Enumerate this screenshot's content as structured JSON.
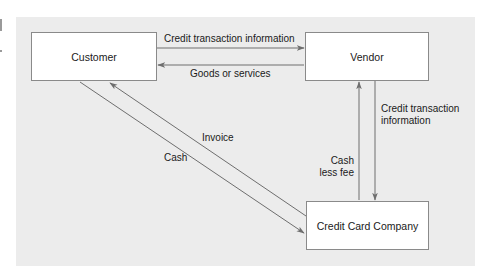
{
  "diagram": {
    "nodes": {
      "customer": {
        "label": "Customer"
      },
      "vendor": {
        "label": "Vendor"
      },
      "credit_card_company": {
        "label": "Credit Card Company"
      }
    },
    "edges": {
      "customer_to_vendor": {
        "label": "Credit transaction information",
        "from": "Customer",
        "to": "Vendor"
      },
      "vendor_to_customer": {
        "label": "Goods or services",
        "from": "Vendor",
        "to": "Customer"
      },
      "vendor_to_ccc": {
        "label_line1": "Credit transaction",
        "label_line2": "information",
        "from": "Vendor",
        "to": "Credit Card Company"
      },
      "ccc_to_vendor": {
        "label_line1": "Cash",
        "label_line2": "less fee",
        "from": "Credit Card Company",
        "to": "Vendor"
      },
      "ccc_to_customer": {
        "label": "Invoice",
        "from": "Credit Card Company",
        "to": "Customer"
      },
      "customer_to_ccc": {
        "label": "Cash",
        "from": "Customer",
        "to": "Credit Card Company"
      }
    },
    "colors": {
      "panel": "#ececec",
      "box_fill": "#ffffff",
      "box_border": "#8a8a8a",
      "arrow": "#6e6e6e",
      "text": "#1a1a1a"
    }
  }
}
